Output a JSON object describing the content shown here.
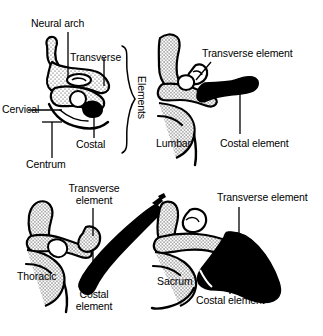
{
  "figure": {
    "background_color": "#ffffff",
    "ink_color": "#000000",
    "stipple_fill": "#d8d8d8",
    "solid_fill": "#000000",
    "bracket_label": "Elements"
  },
  "panels": [
    {
      "id": "cervical",
      "region_label": "Cervical",
      "labels": [
        {
          "key": "neural_arch",
          "text": "Neural arch"
        },
        {
          "key": "transverse",
          "text": "Transverse"
        },
        {
          "key": "costal",
          "text": "Costal"
        },
        {
          "key": "centrum",
          "text": "Centrum"
        }
      ]
    },
    {
      "id": "lumbar",
      "region_label": "Lumbar",
      "labels": [
        {
          "key": "transverse_element",
          "text": "Transverse element"
        },
        {
          "key": "costal_element",
          "text": "Costal element"
        }
      ]
    },
    {
      "id": "thoracic",
      "region_label": "Thoracic",
      "labels": [
        {
          "key": "transverse_element_line1",
          "text": "Transverse"
        },
        {
          "key": "transverse_element_line2",
          "text": "element"
        },
        {
          "key": "costal_element_line1",
          "text": "Costal"
        },
        {
          "key": "costal_element_line2",
          "text": "element"
        }
      ]
    },
    {
      "id": "sacrum",
      "region_label": "Sacrum",
      "labels": [
        {
          "key": "transverse_element",
          "text": "Transverse element"
        },
        {
          "key": "costal_element",
          "text": "Costal element"
        }
      ]
    }
  ]
}
